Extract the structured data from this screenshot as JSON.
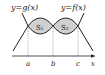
{
  "figure": {
    "labels": {
      "g_curve": "y=g(x)",
      "f_curve": "y=f(x)",
      "region1": "S₁",
      "region2": "S₂",
      "point_a": "a",
      "point_b": "b",
      "point_c": "c",
      "x_axis": "x"
    },
    "colors": {
      "region_fill": "#d0d0d0",
      "stroke": "#222222",
      "guide": "#777777"
    }
  }
}
